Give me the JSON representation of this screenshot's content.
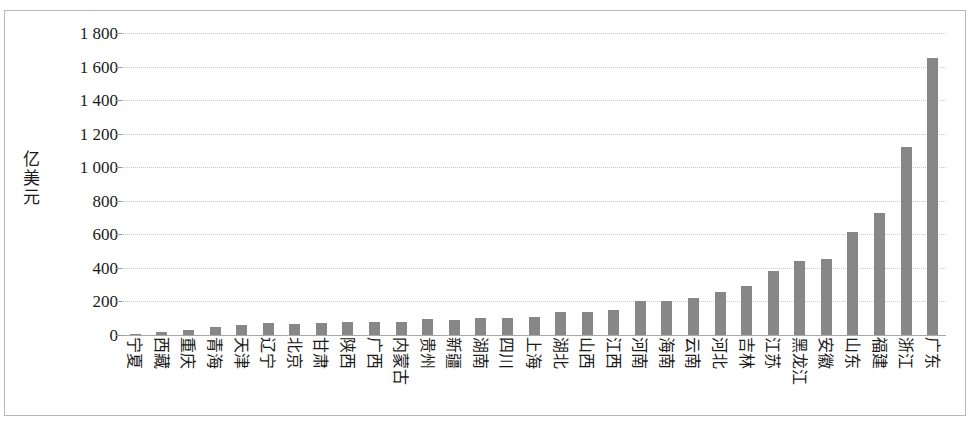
{
  "chart_data": {
    "type": "bar",
    "title": "",
    "subtitle": "",
    "xlabel": "",
    "ylabel": "亿美元",
    "ylim": [
      0,
      1800
    ],
    "ytick_step": 200,
    "ytick_labels": [
      "1 800",
      "1 600",
      "1 400",
      "1 200",
      "1 000",
      "800",
      "600",
      "400",
      "200",
      "0"
    ],
    "ytick_values": [
      1800,
      1600,
      1400,
      1200,
      1000,
      800,
      600,
      400,
      200,
      0
    ],
    "grid": true,
    "legend": false,
    "legend_position": "none",
    "bar_color": "#878787",
    "gridline_color": "#c9c9c9",
    "axis_color": "#a9a9a9",
    "categories": [
      "宁夏",
      "西藏",
      "重庆",
      "青海",
      "天津",
      "辽宁",
      "北京",
      "甘肃",
      "陕西",
      "广西",
      "内蒙古",
      "贵州",
      "新疆",
      "湖南",
      "四川",
      "上海",
      "湖北",
      "山西",
      "江西",
      "河南",
      "海南",
      "云南",
      "河北",
      "吉林",
      "江苏",
      "黑龙江",
      "安徽",
      "山东",
      "福建",
      "浙江",
      "广东"
    ],
    "values": [
      5,
      20,
      30,
      45,
      62,
      70,
      68,
      72,
      75,
      78,
      80,
      95,
      88,
      100,
      100,
      108,
      135,
      140,
      150,
      205,
      205,
      222,
      255,
      290,
      380,
      440,
      455,
      615,
      725,
      1120,
      1650
    ]
  },
  "axis": {
    "unit_caption_chars": [
      "亿",
      "美",
      "元"
    ]
  }
}
